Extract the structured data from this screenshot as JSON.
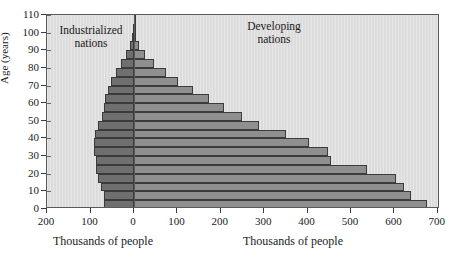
{
  "chart_data": {
    "type": "bar",
    "title": "",
    "subtitle": "",
    "orientation": "horizontal",
    "style": "population-pyramid",
    "ylabel": "Age (years)",
    "xlabel_left": "Thousands of people",
    "xlabel_right": "Thousands of people",
    "ylim": [
      0,
      110
    ],
    "yticks": [
      0,
      10,
      20,
      30,
      40,
      50,
      60,
      70,
      80,
      90,
      100,
      110
    ],
    "xlim_left": [
      0,
      200
    ],
    "xlim_right": [
      0,
      700
    ],
    "xticks_left": [
      200,
      100,
      0
    ],
    "xticks_right": [
      0,
      100,
      200,
      300,
      400,
      500,
      600,
      700
    ],
    "xticks_all_labels": [
      "200",
      "100",
      "0",
      "100",
      "200",
      "300",
      "400",
      "500",
      "600",
      "700"
    ],
    "grid": false,
    "legend_position": "inside-top",
    "annotations": [
      {
        "text_line1": "Industrialized",
        "text_line2": "nations",
        "side": "left"
      },
      {
        "text_line1": "Developing",
        "text_line2": "nations",
        "side": "right"
      }
    ],
    "categories": [
      "0-4",
      "5-9",
      "10-14",
      "15-19",
      "20-24",
      "25-29",
      "30-34",
      "35-39",
      "40-44",
      "45-49",
      "50-54",
      "55-59",
      "60-64",
      "65-69",
      "70-74",
      "75-79",
      "80-84",
      "85-89",
      "90-94",
      "95-99",
      "100-104",
      "105-109"
    ],
    "age_starts": [
      0,
      5,
      10,
      15,
      20,
      25,
      30,
      35,
      40,
      45,
      50,
      55,
      60,
      65,
      70,
      75,
      80,
      85,
      90,
      95,
      100,
      105
    ],
    "series": [
      {
        "name": "Industrialized nations",
        "color": "#6f6f6f",
        "direction": "left",
        "units": "thousands of people",
        "values": [
          70,
          70,
          75,
          82,
          88,
          88,
          92,
          93,
          90,
          82,
          74,
          70,
          66,
          60,
          52,
          42,
          30,
          18,
          9,
          4,
          1.5,
          0.6
        ]
      },
      {
        "name": "Developing nations",
        "color": "#8f8f8f",
        "direction": "right",
        "units": "thousands of people",
        "values": [
          676,
          638,
          622,
          604,
          538,
          455,
          447,
          404,
          350,
          288,
          249,
          208,
          172,
          136,
          101,
          73,
          45,
          25,
          12,
          5,
          2,
          1
        ]
      }
    ]
  },
  "plot_geometry": {
    "zero_x_px": 87,
    "px_per_100_left": 43.5,
    "px_per_100_right": 43.4,
    "row_height_px": 8,
    "axis_bg": "#dcdcdc",
    "frame_color": "#5a5a5a"
  }
}
